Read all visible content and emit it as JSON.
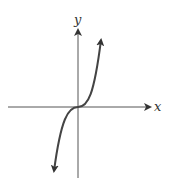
{
  "figure": {
    "type": "graph-sketch",
    "axes": {
      "x_label": "x",
      "y_label": "y"
    },
    "colors": {
      "axis": "#555555",
      "curve": "#444444"
    }
  }
}
